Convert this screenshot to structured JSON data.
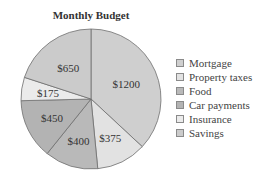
{
  "chart_data": {
    "type": "pie",
    "title": "Monthly Budget",
    "categories": [
      "Mortgage",
      "Property taxes",
      "Food",
      "Car payments",
      "Insurance",
      "Savings"
    ],
    "values": [
      1200,
      375,
      400,
      450,
      175,
      650
    ],
    "labels": [
      "$1200",
      "$375",
      "$400",
      "$450",
      "$175",
      "$650"
    ],
    "colors": [
      "#cfcfcf",
      "#e2e2e2",
      "#b9b9b9",
      "#b3b3b3",
      "#ebebeb",
      "#cbcbcb"
    ],
    "legend_position": "right",
    "start_angle": "top, clockwise"
  }
}
